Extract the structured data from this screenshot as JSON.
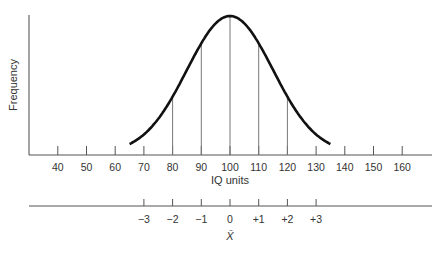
{
  "chart_data": {
    "type": "line",
    "title": "",
    "xlabel": "IQ units",
    "ylabel": "Frequency",
    "distribution": "normal",
    "mean": 100,
    "sd": 15,
    "x_ticks": [
      40,
      50,
      60,
      70,
      80,
      90,
      100,
      110,
      120,
      130,
      140,
      150,
      160
    ],
    "xlim": [
      30,
      170
    ],
    "vertical_lines_at": [
      80,
      90,
      100,
      110,
      120
    ],
    "curve_range": [
      65,
      135
    ],
    "secondary_axis": {
      "label": "X̄",
      "ticks": [
        "−3",
        "−2",
        "−1",
        "0",
        "+1",
        "+2",
        "+3"
      ],
      "tick_positions_iq": [
        70,
        80,
        90,
        100,
        110,
        120,
        130
      ]
    },
    "grid": false,
    "legend": null
  },
  "colors": {
    "curve": "#111111",
    "axis": "#555555",
    "lines": "#777777",
    "text": "#333333"
  }
}
